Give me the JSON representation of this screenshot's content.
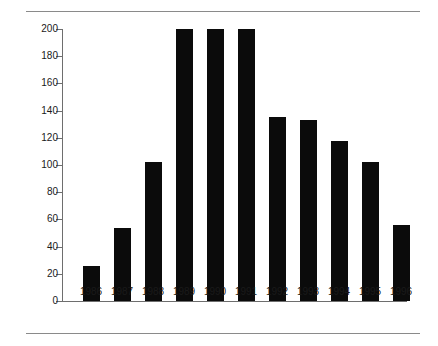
{
  "chart_data": {
    "type": "bar",
    "title": "",
    "subtitle": "",
    "xlabel": "",
    "ylabel": "",
    "categories": [
      "1986",
      "1987",
      "1988",
      "1989",
      "1990",
      "1991",
      "1992",
      "1993",
      "1994",
      "1995",
      "1996"
    ],
    "values": [
      26,
      54,
      102,
      200,
      200,
      200,
      135,
      133,
      118,
      102,
      56
    ],
    "series": [
      {
        "name": "",
        "values": [
          26,
          54,
          102,
          200,
          200,
          200,
          135,
          133,
          118,
          102,
          56
        ]
      }
    ],
    "ylim": [
      0,
      200
    ],
    "ytick_values": [
      0,
      20,
      40,
      60,
      80,
      100,
      120,
      140,
      160,
      180,
      200
    ],
    "ytick_labels": [
      "0",
      "20",
      "40",
      "60",
      "80",
      "100",
      "120",
      "140",
      "160",
      "180",
      "200"
    ],
    "grid": false,
    "legend": false,
    "legend_position": "none",
    "bar_color": "#0b0b0b",
    "axis_color": "#6e6e6e",
    "background_color": "#ffffff",
    "annotations": [
      "Bars for 1989, 1990 and 1991 reach the top of the axis at 200"
    ]
  },
  "decorations": {
    "top_rule_color": "#8a8a8a",
    "bottom_rule_color": "#8a8a8a"
  }
}
